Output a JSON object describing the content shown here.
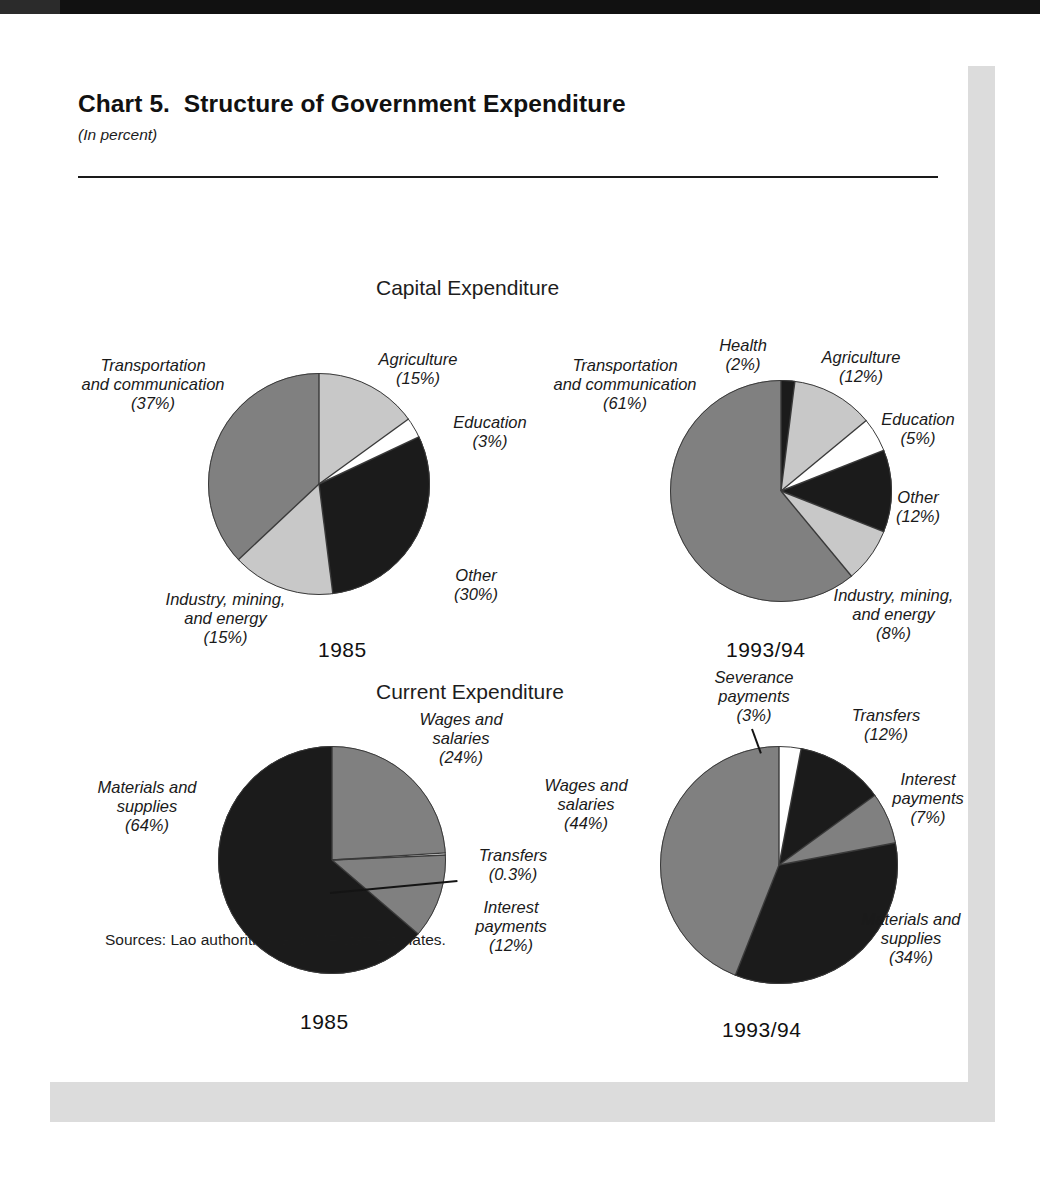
{
  "header": {
    "title": "Chart 5.  Structure of Government Expenditure",
    "subtitle": "(In percent)"
  },
  "sections": {
    "capital": "Capital Expenditure",
    "current": "Current Expenditure"
  },
  "years": {
    "y1985": "1985",
    "y199394": "1993/94"
  },
  "source_note": "Sources: Lao authorities; and IMF staff estimates.",
  "colors": {
    "dark": "#1b1b1b",
    "mid_gray": "#808080",
    "light_gray": "#c8c8c8",
    "white": "#ffffff",
    "outline": "#3a3a3a",
    "panel": "#dcdcdc",
    "band": "#111111"
  },
  "labels": {
    "capital_1985": {
      "transportation": "Transportation\nand communication\n(37%)",
      "agriculture": "Agriculture\n(15%)",
      "education": "Education\n(3%)",
      "other": "Other\n(30%)",
      "industry": "Industry, mining,\nand energy\n(15%)"
    },
    "capital_1993": {
      "transportation": "Transportation\nand communication\n(61%)",
      "health": "Health\n(2%)",
      "agriculture": "Agriculture\n(12%)",
      "education": "Education\n(5%)",
      "other": "Other\n(12%)",
      "industry": "Industry, mining,\nand energy\n(8%)"
    },
    "current_1985": {
      "materials": "Materials and\nsupplies\n(64%)",
      "wages": "Wages and\nsalaries\n(24%)",
      "transfers": "Transfers\n(0.3%)",
      "interest": "Interest\npayments\n(12%)"
    },
    "current_1993": {
      "wages": "Wages and\nsalaries\n(44%)",
      "severance": "Severance\npayments\n(3%)",
      "transfers": "Transfers\n(12%)",
      "interest": "Interest\npayments\n(7%)",
      "materials": "Materials and\nsupplies\n(34%)"
    }
  },
  "chart_data": [
    {
      "type": "pie",
      "title": "Capital Expenditure",
      "subtitle": "1985",
      "unit": "percent",
      "start_angle_deg": 0,
      "direction": "clockwise",
      "categories": [
        "Agriculture",
        "Education",
        "Other",
        "Industry, mining, and energy",
        "Transportation and communication"
      ],
      "values": [
        15,
        3,
        30,
        15,
        37
      ],
      "slice_colors": [
        "#c8c8c8",
        "#ffffff",
        "#1b1b1b",
        "#c8c8c8",
        "#808080"
      ],
      "legend": "none (direct labels)"
    },
    {
      "type": "pie",
      "title": "Capital Expenditure",
      "subtitle": "1993/94",
      "unit": "percent",
      "start_angle_deg": 0,
      "direction": "clockwise",
      "categories": [
        "Health",
        "Agriculture",
        "Education",
        "Other",
        "Industry, mining, and energy",
        "Transportation and communication"
      ],
      "values": [
        2,
        12,
        5,
        12,
        8,
        61
      ],
      "slice_colors": [
        "#1b1b1b",
        "#c8c8c8",
        "#ffffff",
        "#1b1b1b",
        "#c8c8c8",
        "#808080"
      ],
      "legend": "none (direct labels)"
    },
    {
      "type": "pie",
      "title": "Current Expenditure",
      "subtitle": "1985",
      "unit": "percent",
      "start_angle_deg": 0,
      "direction": "clockwise",
      "categories": [
        "Wages and salaries",
        "Transfers",
        "Interest payments",
        "Materials and supplies"
      ],
      "values": [
        24,
        0.3,
        12,
        63.7
      ],
      "slice_colors": [
        "#808080",
        "#ffffff",
        "#808080",
        "#1b1b1b"
      ],
      "legend": "none (direct labels)"
    },
    {
      "type": "pie",
      "title": "Current Expenditure",
      "subtitle": "1993/94",
      "unit": "percent",
      "start_angle_deg": 0,
      "direction": "clockwise",
      "categories": [
        "Severance payments",
        "Transfers",
        "Interest payments",
        "Materials and supplies",
        "Wages and salaries"
      ],
      "values": [
        3,
        12,
        7,
        34,
        44
      ],
      "slice_colors": [
        "#ffffff",
        "#1b1b1b",
        "#808080",
        "#1b1b1b",
        "#808080"
      ],
      "legend": "none (direct labels)"
    }
  ]
}
